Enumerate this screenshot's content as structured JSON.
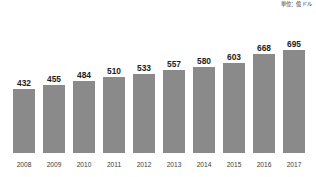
{
  "chart_data": {
    "type": "bar",
    "title": "",
    "subtitle": "",
    "xlabel": "",
    "ylabel": "",
    "unit_note": "単位：億ドル",
    "categories": [
      "2008",
      "2009",
      "2010",
      "2011",
      "2012",
      "2013",
      "2014",
      "2015",
      "2016",
      "2017"
    ],
    "values": [
      432,
      455,
      484,
      510,
      533,
      557,
      580,
      603,
      668,
      695
    ],
    "series": [
      {
        "name": "",
        "values": [
          432,
          455,
          484,
          510,
          533,
          557,
          580,
          603,
          668,
          695
        ]
      }
    ],
    "ylim": [
      0,
      760
    ],
    "grid": false,
    "legend": "none",
    "bar_color": "#8a8a8a",
    "label_color": "#1d1d1d",
    "category_color": "#3b3b3b",
    "background_color": "#ffffff"
  }
}
